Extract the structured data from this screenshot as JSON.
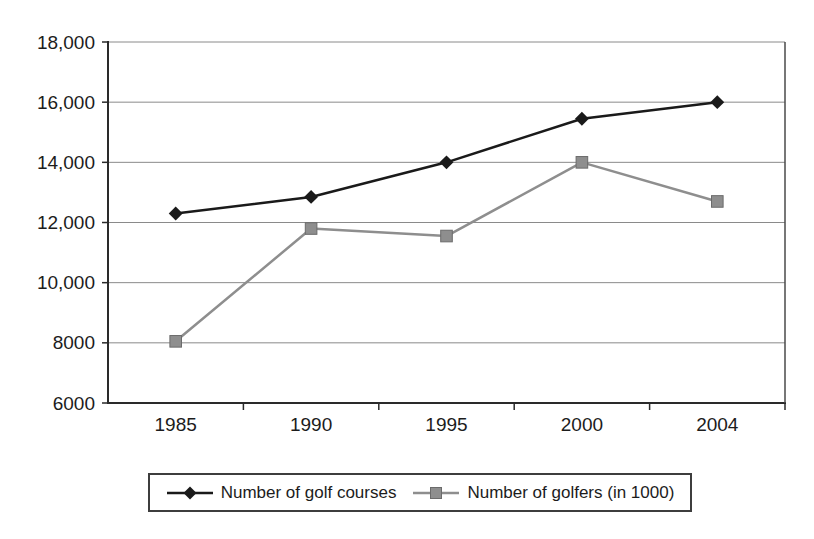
{
  "chart_data": {
    "type": "line",
    "categories": [
      "1985",
      "1990",
      "1995",
      "2000",
      "2004"
    ],
    "series": [
      {
        "name": "Number of golf courses",
        "values": [
          12300,
          12850,
          14000,
          15450,
          16000
        ],
        "color": "#1a1a1a",
        "marker": "diamond"
      },
      {
        "name": "Number of golfers (in 1000)",
        "values": [
          8050,
          11800,
          11550,
          14000,
          12700
        ],
        "color": "#8e8e8e",
        "marker": "square"
      }
    ],
    "title": "",
    "xlabel": "",
    "ylabel": "",
    "ylim": [
      6000,
      18000
    ],
    "ytick_step": 2000,
    "ytick_labels": [
      "6000",
      "8000",
      "10,000",
      "12,000",
      "14,000",
      "16,000",
      "18,000"
    ],
    "grid": true,
    "legend_position": "bottom",
    "colors": {
      "gridline": "#8a8a8a",
      "axis": "#2a2a2a",
      "plot_right_border": "#4a4a4a",
      "text": "#1c1c1c",
      "background": "#ffffff"
    }
  }
}
